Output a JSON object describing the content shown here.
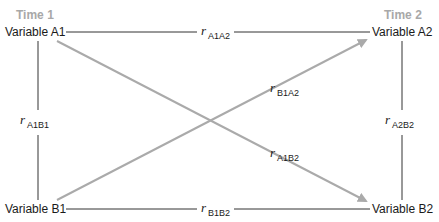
{
  "diagram": {
    "type": "cross-lagged panel",
    "time_labels": {
      "time1": "Time 1",
      "time2": "Time 2"
    },
    "nodes": {
      "A1": "Variable A1",
      "A2": "Variable A2",
      "B1": "Variable B1",
      "B2": "Variable B2"
    },
    "edges": [
      {
        "id": "A1A2",
        "from": "A1",
        "to": "A2",
        "symbol": "r",
        "subscript": "A1A2",
        "style": "line",
        "color": "#333333"
      },
      {
        "id": "B1B2",
        "from": "B1",
        "to": "B2",
        "symbol": "r",
        "subscript": "B1B2",
        "style": "line",
        "color": "#333333"
      },
      {
        "id": "A1B1",
        "from": "A1",
        "to": "B1",
        "symbol": "r",
        "subscript": "A1B1",
        "style": "line",
        "color": "#333333"
      },
      {
        "id": "A2B2",
        "from": "A2",
        "to": "B2",
        "symbol": "r",
        "subscript": "A2B2",
        "style": "line",
        "color": "#333333"
      },
      {
        "id": "B1A2",
        "from": "B1",
        "to": "A2",
        "symbol": "r",
        "subscript": "B1A2",
        "style": "arrow",
        "color": "#aaaaaa"
      },
      {
        "id": "A1B2",
        "from": "A1",
        "to": "B2",
        "symbol": "r",
        "subscript": "A1B2",
        "style": "arrow",
        "color": "#aaaaaa"
      }
    ],
    "colors": {
      "time_label": "#a8a8a8",
      "text": "#1a1a1a",
      "line": "#333333",
      "arrow": "#aaaaaa"
    }
  }
}
